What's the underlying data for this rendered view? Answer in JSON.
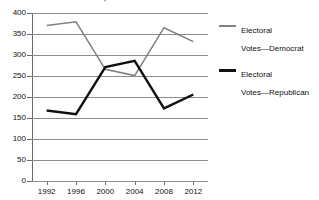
{
  "chart_data": {
    "type": "line",
    "title": "Elections, 1992-2012",
    "xlabel": "",
    "ylabel": "",
    "categories": [
      "1992",
      "1996",
      "2000",
      "2004",
      "2008",
      "2012"
    ],
    "series": [
      {
        "name": "Electoral Votes—Democrat",
        "color": "#808080",
        "values": [
          370,
          379,
          266,
          251,
          365,
          332
        ]
      },
      {
        "name": "Electoral Votes—Republican",
        "color": "#111111",
        "values": [
          168,
          159,
          271,
          286,
          173,
          206
        ]
      }
    ],
    "ylim": [
      0,
      400
    ],
    "ytick_values": [
      "400",
      "350",
      "300",
      "250",
      "200",
      "150",
      "100",
      "50",
      "0"
    ],
    "grid": true,
    "legend_position": "right"
  },
  "legend": {
    "items": [
      {
        "label": "Electoral\nVotes—Democrat"
      },
      {
        "label": "Electoral\nVotes—Republican"
      }
    ]
  }
}
